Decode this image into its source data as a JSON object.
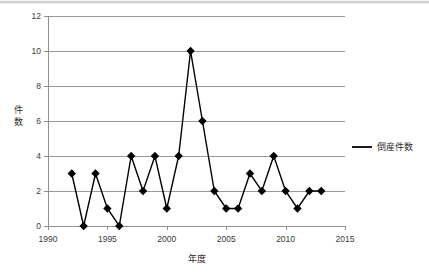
{
  "chart_data": {
    "type": "line",
    "title": "",
    "xlabel": "年度",
    "ylabel": "件数",
    "xlim": [
      1990,
      2015
    ],
    "ylim": [
      0,
      12
    ],
    "xticks": [
      "1990",
      "1995",
      "2000",
      "2005",
      "2010",
      "2015"
    ],
    "xtick_values": [
      1990,
      1995,
      2000,
      2005,
      2010,
      2015
    ],
    "yticks": [
      "0",
      "2",
      "4",
      "6",
      "8",
      "10",
      "12"
    ],
    "ytick_values": [
      0,
      2,
      4,
      6,
      8,
      10,
      12
    ],
    "grid": "horizontal",
    "legend_position": "right",
    "marker": "diamond",
    "series": [
      {
        "name": "倒産件数",
        "color": "#000000",
        "x": [
          1992,
          1993,
          1994,
          1995,
          1996,
          1997,
          1998,
          1999,
          2000,
          2001,
          2002,
          2003,
          2004,
          2005,
          2006,
          2007,
          2008,
          2009,
          2010,
          2011,
          2012,
          2013
        ],
        "values": [
          3,
          0,
          3,
          1,
          0,
          4,
          2,
          4,
          1,
          4,
          10,
          6,
          2,
          1,
          1,
          3,
          2,
          4,
          2,
          1,
          2,
          2
        ]
      }
    ]
  },
  "legend": {
    "entries": [
      {
        "label": "倒産件数"
      }
    ]
  },
  "axes": {
    "y_title": "件数",
    "y_title_chars": [
      "件",
      "数"
    ],
    "x_title": "年度"
  }
}
